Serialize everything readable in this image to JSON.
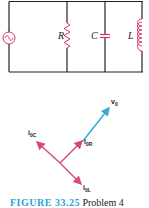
{
  "circuit": {
    "source_label": "",
    "components": [
      {
        "id": "R",
        "label": "R",
        "type": "resistor"
      },
      {
        "id": "C",
        "label": "C",
        "type": "capacitor"
      },
      {
        "id": "L",
        "label": "L",
        "type": "inductor"
      }
    ]
  },
  "phasor": {
    "v0": {
      "label": "v",
      "sub": "0"
    },
    "i0R": {
      "label": "i",
      "sub": "0R"
    },
    "i0C": {
      "label": "i",
      "sub": "0C"
    },
    "i0L": {
      "label": "i",
      "sub": "0L"
    }
  },
  "colors": {
    "wire": "#222222",
    "component": "#d6336c",
    "current": "#d94a7a",
    "voltage": "#3aaad6",
    "caption_accent": "#2aa3d6"
  },
  "caption": {
    "figure": "FIGURE 33.25",
    "text": "Problem 4"
  }
}
